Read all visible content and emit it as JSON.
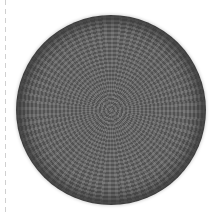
{
  "image": {
    "subject": "crocheted round cap (kippah) in dark gray yarn, viewed from above",
    "background_color": "#ffffff",
    "object_color": "#4a4a4a",
    "guide_line": "dashed light gray vertical line at left edge"
  }
}
